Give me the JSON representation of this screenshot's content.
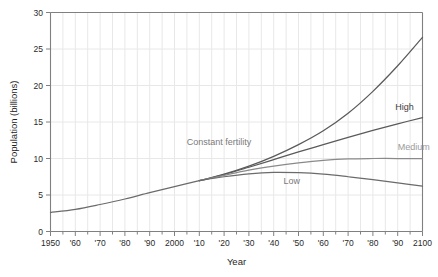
{
  "chart_data": {
    "type": "line",
    "title": "",
    "xlabel": "Year",
    "ylabel": "Population (billions)",
    "xlim": [
      1950,
      2100
    ],
    "ylim": [
      0,
      30
    ],
    "grid": true,
    "legend_position": "inline-annotations",
    "x_tick_labels": [
      "1950",
      "'60",
      "'70",
      "'80",
      "'90",
      "2000",
      "'10",
      "'20",
      "'30",
      "'40",
      "'50",
      "'60",
      "'70",
      "'80",
      "'90",
      "2100"
    ],
    "x_tick_values": [
      1950,
      1960,
      1970,
      1980,
      1990,
      2000,
      2010,
      2020,
      2030,
      2040,
      2050,
      2060,
      2070,
      2080,
      2090,
      2100
    ],
    "x_minor_step": 5,
    "y_tick_labels": [
      "0",
      "5",
      "10",
      "15",
      "20",
      "25",
      "30"
    ],
    "y_tick_values": [
      0,
      5,
      10,
      15,
      20,
      25,
      30
    ],
    "x": [
      1950,
      1960,
      1970,
      1980,
      1990,
      2000,
      2010,
      2020,
      2030,
      2040,
      2050,
      2060,
      2070,
      2080,
      2090,
      2100
    ],
    "series": [
      {
        "name": "Historical",
        "label": "",
        "color": "#6b6b6b",
        "values": [
          2.6,
          3.03,
          3.7,
          4.45,
          5.32,
          6.14,
          6.96,
          null,
          null,
          null,
          null,
          null,
          null,
          null,
          null,
          null
        ]
      },
      {
        "name": "Constant fertility",
        "label": "Constant fertility",
        "color": "#5a5a5a",
        "values": [
          null,
          null,
          null,
          null,
          null,
          null,
          6.96,
          7.85,
          8.95,
          10.3,
          11.9,
          13.8,
          16.2,
          19.2,
          22.7,
          26.6
        ]
      },
      {
        "name": "High",
        "label": "High",
        "color": "#5a5a5a",
        "values": [
          null,
          null,
          null,
          null,
          null,
          null,
          6.96,
          7.8,
          8.8,
          9.85,
          10.9,
          11.9,
          12.9,
          13.85,
          14.75,
          15.6
        ]
      },
      {
        "name": "Medium",
        "label": "Medium",
        "color": "#8a8a8a",
        "values": [
          null,
          null,
          null,
          null,
          null,
          null,
          6.96,
          7.7,
          8.4,
          8.95,
          9.4,
          9.75,
          9.95,
          10.0,
          10.0,
          10.0
        ]
      },
      {
        "name": "Low",
        "label": "Low",
        "color": "#6b6b6b",
        "values": [
          null,
          null,
          null,
          null,
          null,
          null,
          6.96,
          7.5,
          7.9,
          8.1,
          8.05,
          7.85,
          7.5,
          7.1,
          6.65,
          6.2
        ]
      }
    ],
    "annotations": [
      {
        "text": "Constant fertility",
        "x": 2031,
        "y": 11.9,
        "color": "#7a7a7a",
        "anchor": "end"
      },
      {
        "text": "High",
        "x": 2089,
        "y": 16.6,
        "color": "#3d3d3d",
        "anchor": "start"
      },
      {
        "text": "Medium",
        "x": 2090,
        "y": 11.1,
        "color": "#9a9a9a",
        "anchor": "start"
      },
      {
        "text": "Low",
        "x": 2044,
        "y": 6.45,
        "color": "#7a7a7a",
        "anchor": "start"
      }
    ],
    "colors": {
      "background": "#ffffff",
      "grid": "#e8e8e8",
      "axis": "#808080",
      "tick_text": "#2a2a2a",
      "axis_title": "#1f1f1f"
    }
  }
}
